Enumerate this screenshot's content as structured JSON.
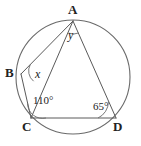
{
  "figure": {
    "stroke_color": "#5a5a5a",
    "circle_color": "#6a6a6a",
    "text_color": "#222222",
    "background": "#ffffff"
  },
  "circle": {
    "center_x": 73,
    "center_y": 77,
    "radius": 57
  },
  "vertices": [
    {
      "id": "A",
      "label": "A",
      "x": 73,
      "y": 21
    },
    {
      "id": "B",
      "label": "B",
      "x": 21,
      "y": 74
    },
    {
      "id": "C",
      "label": "C",
      "x": 31,
      "y": 118
    },
    {
      "id": "D",
      "label": "D",
      "x": 116,
      "y": 118
    }
  ],
  "angles": [
    {
      "id": "y",
      "label": "y",
      "vertex": "A",
      "x": 70,
      "y": 31
    },
    {
      "id": "x",
      "label": "x",
      "vertex": "B",
      "x": 36,
      "y": 74
    },
    {
      "id": "angle-c",
      "label": "110°",
      "vertex": "C",
      "x": 45,
      "y": 100
    },
    {
      "id": "angle-d",
      "label": "65°",
      "vertex": "D",
      "x": 101,
      "y": 106
    }
  ],
  "segments": [
    {
      "id": "A-B",
      "from": "A",
      "to": "B"
    },
    {
      "id": "A-D",
      "from": "A",
      "to": "D"
    },
    {
      "id": "B-C",
      "from": "B",
      "to": "C"
    },
    {
      "id": "C-D",
      "from": "C",
      "to": "D"
    },
    {
      "id": "A-C",
      "from": "A",
      "to": "C"
    }
  ]
}
